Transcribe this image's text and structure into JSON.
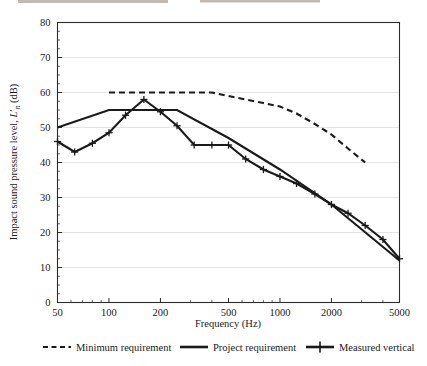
{
  "chart_data": {
    "type": "line",
    "title": "",
    "xlabel": "Frequency (Hz)",
    "ylabel": "Impact sound pressure level, L'ₙ (dB)",
    "ylabel_parts": {
      "prefix": "Impact sound pressure level, ",
      "symbol": "L",
      "subscript": "n",
      "suffix": " (dB)"
    },
    "xscale": "log",
    "xlim": [
      50,
      5000
    ],
    "ylim": [
      0,
      80
    ],
    "yticks": [
      0,
      10,
      20,
      30,
      40,
      50,
      60,
      70,
      80
    ],
    "ytick_labels": [
      "0",
      "10",
      "20",
      "30",
      "40",
      "50",
      "60",
      "70",
      "80"
    ],
    "xticks": [
      50,
      100,
      200,
      500,
      1000,
      2000,
      5000
    ],
    "xtick_labels": [
      "50",
      "100",
      "200",
      "500",
      "1000",
      "2000",
      "5000"
    ],
    "grid": "horizontal",
    "legend_position": "below",
    "series": [
      {
        "name": "Minimum requirement",
        "style": "dashed",
        "marker": "none",
        "color": "#1a1a1a",
        "x": [
          100,
          125,
          160,
          200,
          250,
          315,
          400,
          500,
          630,
          800,
          1000,
          1250,
          1600,
          2000,
          2500,
          3150
        ],
        "values": [
          60,
          60,
          60,
          60,
          60,
          60,
          60,
          59,
          58,
          57,
          56,
          54,
          51,
          48,
          44,
          40
        ]
      },
      {
        "name": "Project requirement",
        "style": "solid",
        "marker": "none",
        "color": "#1a1a1a",
        "x": [
          50,
          100,
          200,
          250,
          500,
          1000,
          2000,
          5000
        ],
        "values": [
          50,
          55,
          55,
          55,
          47,
          38,
          28,
          12
        ]
      },
      {
        "name": "Measured vertical",
        "style": "solid",
        "marker": "plus",
        "color": "#1a1a1a",
        "x": [
          50,
          63,
          80,
          100,
          125,
          160,
          200,
          250,
          315,
          400,
          500,
          630,
          800,
          1000,
          1250,
          1600,
          2000,
          2500,
          3150,
          4000,
          5000
        ],
        "values": [
          46,
          43,
          45.5,
          48.5,
          53.5,
          58,
          54.5,
          50.5,
          45,
          45,
          45,
          41,
          38,
          36,
          34,
          31,
          28,
          25.5,
          22,
          18,
          12.5
        ]
      }
    ]
  },
  "legend": {
    "items": [
      {
        "label": "Minimum requirement",
        "style": "dashed",
        "marker": "none"
      },
      {
        "label": "Project requirement",
        "style": "solid",
        "marker": "none"
      },
      {
        "label": "Measured vertical",
        "style": "solid",
        "marker": "plus"
      }
    ]
  },
  "colors": {
    "line": "#1a1a1a",
    "grid": "#d9d9d9",
    "frame": "#2b2b2b",
    "background": "#ffffff"
  }
}
